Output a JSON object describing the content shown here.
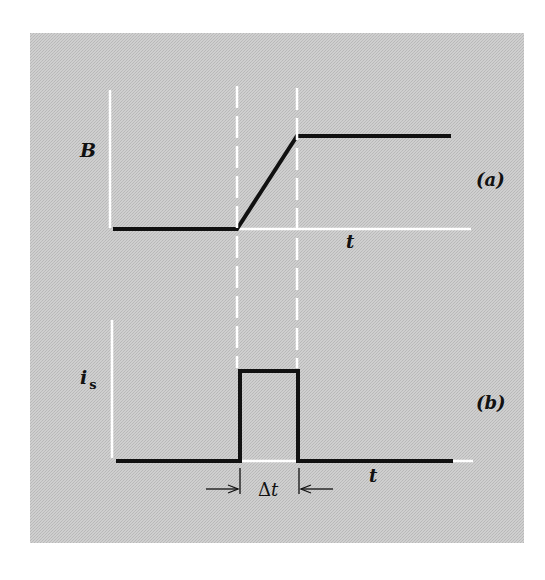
{
  "figure": {
    "panel_a": {
      "label": "(a)",
      "y_label": "B",
      "x_label": "t"
    },
    "panel_b": {
      "label": "(b)",
      "y_label_main": "i",
      "y_label_sub": "s",
      "x_label": "t",
      "interval_delta": "Δ",
      "interval_var": "t"
    }
  },
  "colors": {
    "background": "#c8c8c8",
    "curve": "#111111",
    "axis": "#ffffff",
    "text": "#111111"
  }
}
